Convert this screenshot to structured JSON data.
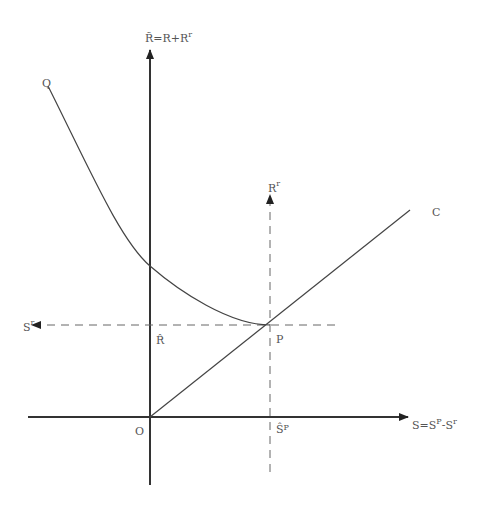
{
  "diagram": {
    "colors": {
      "axis": "#333333",
      "curve": "#444444",
      "dashed": "#666666",
      "text": "#555555"
    },
    "labels": {
      "y_axis": {
        "base": "R̃=R+R",
        "sup": "r"
      },
      "x_axis": {
        "base": "S=S",
        "sup1": "P",
        "mid": "-S",
        "sup2": "r"
      },
      "curve_q": "Q",
      "line_c": "C",
      "origin": "O",
      "point_p": "P",
      "r_hat": "R̂",
      "sp_hat": {
        "base": "Ŝ",
        "sup": "P"
      },
      "rr_axis": {
        "base": "R",
        "sup": "r"
      },
      "sr_axis": {
        "base": "S",
        "sup": "r"
      }
    }
  }
}
